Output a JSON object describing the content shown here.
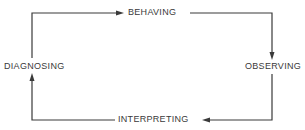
{
  "diagram": {
    "type": "cycle",
    "nodes": [
      {
        "id": "behaving",
        "label": "BEHAVING"
      },
      {
        "id": "observing",
        "label": "OBSERVING"
      },
      {
        "id": "interpreting",
        "label": "INTERPRETING"
      },
      {
        "id": "diagnosing",
        "label": "DIAGNOSING"
      }
    ],
    "edges": [
      {
        "from": "diagnosing",
        "to": "behaving"
      },
      {
        "from": "behaving",
        "to": "observing"
      },
      {
        "from": "observing",
        "to": "interpreting"
      },
      {
        "from": "interpreting",
        "to": "diagnosing"
      }
    ],
    "colors": {
      "line": "#3a3a3a",
      "text": "#3a3a3a"
    }
  }
}
